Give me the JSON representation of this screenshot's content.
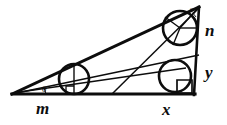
{
  "figure": {
    "background_color": "#ffffff",
    "stroke_color": "#0d0d0d",
    "labels": {
      "base_left_segment": "m",
      "base_right_segment": "x",
      "right_lower_segment": "y",
      "right_upper_segment": "n",
      "left_vertex_angle": "θ",
      "top_vertex_angle": "α"
    },
    "vertices": {
      "left": [
        12,
        94
      ],
      "bottom_right": [
        193,
        94
      ],
      "top_right": [
        199,
        7
      ]
    },
    "circles": [
      {
        "name": "left-incircle",
        "cx": 74,
        "cy": 79,
        "r": 15
      },
      {
        "name": "lower-right-incircle",
        "cx": 175,
        "cy": 76,
        "r": 16
      },
      {
        "name": "upper-right-incircle",
        "cx": 180,
        "cy": 28,
        "r": 17
      }
    ],
    "right_angle_markers": [
      {
        "name": "left-circle-tangent-marker",
        "x": 72,
        "y": 84,
        "size": 9
      },
      {
        "name": "lower-right-tangent-marker",
        "x": 172,
        "y": 82,
        "size": 12
      }
    ],
    "cevians": [
      {
        "name": "cevian-left-to-right-edge",
        "from": [
          12,
          94
        ],
        "to": [
          199,
          55
        ]
      },
      {
        "name": "cevian-top-to-base",
        "from": [
          199,
          7
        ],
        "to": [
          112,
          94
        ]
      },
      {
        "name": "cevian-left-shallow",
        "from": [
          12,
          94
        ],
        "to": [
          193,
          68
        ]
      }
    ],
    "radii_segments": [
      {
        "name": "left-circle-vertical-radius",
        "from": [
          74,
          64
        ],
        "to": [
          74,
          94
        ]
      },
      {
        "name": "upper-circle-horizontal-radius",
        "from": [
          180,
          28
        ],
        "to": [
          199,
          28
        ]
      },
      {
        "name": "upper-circle-radius-to-apex",
        "from": [
          180,
          28
        ],
        "to": [
          199,
          7
        ]
      },
      {
        "name": "upper-circle-radius-down",
        "from": [
          180,
          28
        ],
        "to": [
          172,
          45
        ]
      },
      {
        "name": "upper-circle-radius-left",
        "from": [
          180,
          28
        ],
        "to": [
          166,
          18
        ]
      }
    ]
  }
}
